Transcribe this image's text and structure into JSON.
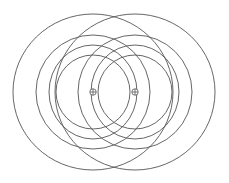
{
  "diagram": {
    "type": "two-centre concentric rings",
    "background": "#ffffff",
    "stroke_color": "#555555",
    "stroke_width": 0.9,
    "foci": [
      {
        "id": "left-focus",
        "x": 93,
        "y": 92,
        "marker": "circle-plus"
      },
      {
        "id": "right-focus",
        "x": 135,
        "y": 92,
        "marker": "circle-plus"
      }
    ],
    "rings": [
      {
        "rx": 80,
        "ry": 78
      },
      {
        "rx": 57,
        "ry": 57
      },
      {
        "rx": 44,
        "ry": 47
      },
      {
        "rx": 37,
        "ry": 37
      }
    ],
    "marker_radius": 3.2
  }
}
